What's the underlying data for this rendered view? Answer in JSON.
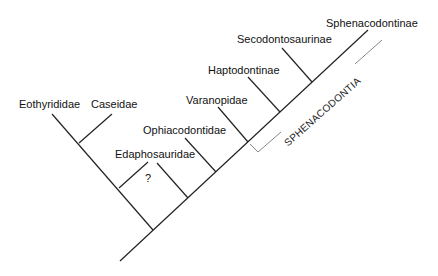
{
  "diagram": {
    "type": "cladogram",
    "taxa": [
      {
        "id": "eothyrididae",
        "label": "Eothyrididae"
      },
      {
        "id": "caseidae",
        "label": "Caseidae"
      },
      {
        "id": "edaphosauridae",
        "label": "Edaphosauridae"
      },
      {
        "id": "ophiacodontidae",
        "label": "Ophiacodontidae"
      },
      {
        "id": "varanopidae",
        "label": "Varanopidae"
      },
      {
        "id": "haptodontinae",
        "label": "Haptodontinae"
      },
      {
        "id": "secodontosaurinae",
        "label": "Secodontosaurinae"
      },
      {
        "id": "sphenacodontinae",
        "label": "Sphenacodontinae"
      }
    ],
    "uncertain_mark": "?",
    "clade_bracket": {
      "label": "SPHENACODONTIA",
      "color": "#888888"
    },
    "line_color": "#222222"
  }
}
